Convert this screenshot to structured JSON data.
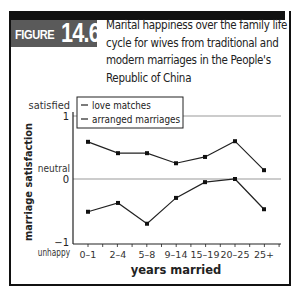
{
  "figure": {
    "label": "FIGURE",
    "number": "14.6",
    "caption": "Marital happiness over the family life cycle for wives from traditional and modern marriages in the People's Republic of China"
  },
  "chart_data": {
    "type": "line",
    "title": "Marital happiness over the family life cycle for wives from traditional and modern marriages in the People's Republic of China",
    "xlabel": "years married",
    "ylabel": "marriage satisfaction",
    "categories": [
      "0–1",
      "2–4",
      "5–8",
      "9–14",
      "15–19",
      "20–25",
      "25+"
    ],
    "ylim": [
      -1,
      1
    ],
    "y_ticks": [
      {
        "value": 1,
        "label": "1",
        "annotation": "satisfied"
      },
      {
        "value": 0,
        "label": "0",
        "annotation": "neutral"
      },
      {
        "value": -1,
        "label": "−1",
        "annotation": "unhappy"
      }
    ],
    "reference_lines": [
      1,
      0
    ],
    "legend_position": "top-left inside",
    "series": [
      {
        "name": "love matches",
        "values": [
          0.59,
          0.41,
          0.41,
          0.25,
          0.35,
          0.6,
          0.14
        ]
      },
      {
        "name": "arranged marriages",
        "values": [
          -0.52,
          -0.38,
          -0.71,
          -0.3,
          -0.05,
          0.0,
          -0.48
        ]
      }
    ]
  },
  "colors": {
    "frame": "#111111",
    "figure_box": "#5a5a5a",
    "line": "#222222",
    "gridline": "#999999"
  }
}
